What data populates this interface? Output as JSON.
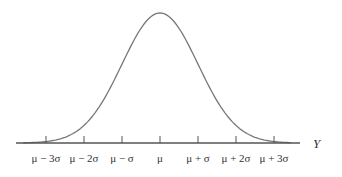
{
  "chart_data": {
    "type": "line",
    "title": "",
    "xlabel": "Y",
    "ylabel": "",
    "x_ticks": [
      "μ − 3σ",
      "μ − 2σ",
      "μ − σ",
      "μ",
      "μ + σ",
      "μ + 2σ",
      "μ + 3σ"
    ],
    "x_tick_values": [
      -3,
      -2,
      -1,
      0,
      1,
      2,
      3
    ],
    "xlim": [
      -3.8,
      3.7
    ],
    "grid": false,
    "legend": null,
    "series": [
      {
        "name": "normal density",
        "function": "exp(-z^2/2)",
        "peak_at": 0
      }
    ]
  },
  "colors": {
    "curve": "#777777",
    "axis": "#555555",
    "text": "#333333"
  }
}
